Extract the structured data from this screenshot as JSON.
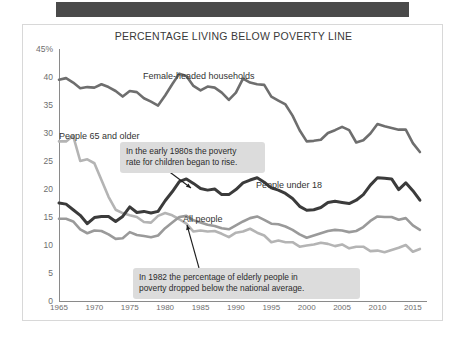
{
  "topband": {
    "label": ""
  },
  "chart_data": {
    "type": "line",
    "title": "PERCENTAGE LIVING BELOW POVERTY LINE",
    "xlabel": "",
    "ylabel": "",
    "xlim": [
      1965,
      2017
    ],
    "ylim": [
      0,
      45
    ],
    "grid": false,
    "legend_position": "inline-labels",
    "xticks": [
      "1965",
      "1970",
      "1975",
      "1980",
      "1985",
      "1990",
      "1995",
      "2000",
      "2005",
      "2010",
      "2015"
    ],
    "xtick_values": [
      1965,
      1970,
      1975,
      1980,
      1985,
      1990,
      1995,
      2000,
      2005,
      2010,
      2015
    ],
    "yticks": [
      "0",
      "5",
      "10",
      "15",
      "20",
      "25",
      "30",
      "35",
      "40",
      "45%"
    ],
    "ytick_values": [
      0,
      5,
      10,
      15,
      20,
      25,
      30,
      35,
      40,
      45
    ],
    "x": [
      1965,
      1966,
      1967,
      1968,
      1969,
      1970,
      1971,
      1972,
      1973,
      1974,
      1975,
      1976,
      1977,
      1978,
      1979,
      1980,
      1981,
      1982,
      1983,
      1984,
      1985,
      1986,
      1987,
      1988,
      1989,
      1990,
      1991,
      1992,
      1993,
      1994,
      1995,
      1996,
      1997,
      1998,
      1999,
      2000,
      2001,
      2002,
      2003,
      2004,
      2005,
      2006,
      2007,
      2008,
      2009,
      2010,
      2011,
      2012,
      2013,
      2014,
      2015,
      2016
    ],
    "series": [
      {
        "name": "Female-headed households",
        "color": "#6e6e6e",
        "width": 2.6,
        "values": [
          39.5,
          39.8,
          39.0,
          38.0,
          38.2,
          38.1,
          38.7,
          38.2,
          37.5,
          36.5,
          37.5,
          37.3,
          36.2,
          35.6,
          34.9,
          36.7,
          38.7,
          40.6,
          40.2,
          38.4,
          37.6,
          38.3,
          38.1,
          37.2,
          35.9,
          37.2,
          39.7,
          39.0,
          38.7,
          38.6,
          36.5,
          35.8,
          35.1,
          33.1,
          30.5,
          28.5,
          28.6,
          28.8,
          30.0,
          30.5,
          31.1,
          30.5,
          28.3,
          28.7,
          29.9,
          31.6,
          31.2,
          30.9,
          30.6,
          30.6,
          28.2,
          26.6
        ]
      },
      {
        "name": "People 65 and older",
        "color": "#b4b4b4",
        "width": 2.6,
        "values": [
          28.5,
          28.5,
          29.5,
          25.0,
          25.3,
          24.6,
          21.6,
          18.6,
          16.3,
          15.7,
          15.3,
          15.0,
          14.1,
          14.0,
          15.2,
          15.7,
          15.3,
          14.6,
          13.8,
          12.4,
          12.6,
          12.4,
          12.5,
          12.0,
          11.4,
          12.2,
          12.4,
          12.9,
          12.2,
          11.7,
          10.5,
          10.8,
          10.5,
          10.5,
          9.7,
          9.9,
          10.1,
          10.4,
          10.2,
          9.8,
          10.1,
          9.4,
          9.7,
          9.7,
          8.9,
          9.0,
          8.7,
          9.1,
          9.5,
          10.0,
          8.8,
          9.3
        ]
      },
      {
        "name": "People under 18",
        "color": "#3b3b3b",
        "width": 3.0,
        "values": [
          17.5,
          17.3,
          16.3,
          15.3,
          13.8,
          14.9,
          15.1,
          15.1,
          14.2,
          15.1,
          16.8,
          15.8,
          16.0,
          15.7,
          16.0,
          17.9,
          19.5,
          21.3,
          21.8,
          21.0,
          20.1,
          19.8,
          20.0,
          19.0,
          19.0,
          19.9,
          21.1,
          21.6,
          22.0,
          21.2,
          20.2,
          19.8,
          19.2,
          18.3,
          16.9,
          16.2,
          16.3,
          16.7,
          17.6,
          17.8,
          17.6,
          17.4,
          18.0,
          19.0,
          20.7,
          22.0,
          21.9,
          21.8,
          19.9,
          21.1,
          19.7,
          18.0
        ]
      },
      {
        "name": "All people",
        "color": "#9a9a9a",
        "width": 2.6,
        "values": [
          14.7,
          14.7,
          14.2,
          12.8,
          12.1,
          12.6,
          12.5,
          11.9,
          11.1,
          11.2,
          12.3,
          11.8,
          11.6,
          11.4,
          11.7,
          13.0,
          14.0,
          15.0,
          15.2,
          14.4,
          14.0,
          13.6,
          13.4,
          13.0,
          12.8,
          13.5,
          14.2,
          14.8,
          15.1,
          14.5,
          13.8,
          13.7,
          13.3,
          12.7,
          11.9,
          11.3,
          11.7,
          12.1,
          12.5,
          12.7,
          12.6,
          12.3,
          12.5,
          13.2,
          14.3,
          15.1,
          15.0,
          15.0,
          14.5,
          14.8,
          13.5,
          12.7
        ]
      }
    ],
    "series_labels": [
      {
        "text": "Female-headed households",
        "x_px": 120,
        "y_px": 46
      },
      {
        "text": "People 65 and older",
        "x_px": 36,
        "y_px": 106
      },
      {
        "text": "People under 18",
        "x_px": 233,
        "y_px": 155
      },
      {
        "text": "All people",
        "x_px": 160,
        "y_px": 189
      }
    ],
    "annotations": [
      {
        "text": "In the early 1980s the poverty\nrate for children began to rise.",
        "x_px": 97,
        "y_px": 117,
        "width_px": 133,
        "arrow": {
          "x1": 144,
          "y1": 145,
          "x2": 168,
          "y2": 163
        }
      },
      {
        "text": "In 1982 the percentage of elderly people in\npoverty dropped below the national average.",
        "x_px": 110,
        "y_px": 243,
        "width_px": 215,
        "arrow": {
          "x1": 176,
          "y1": 243,
          "x2": 164,
          "y2": 200
        }
      }
    ]
  }
}
